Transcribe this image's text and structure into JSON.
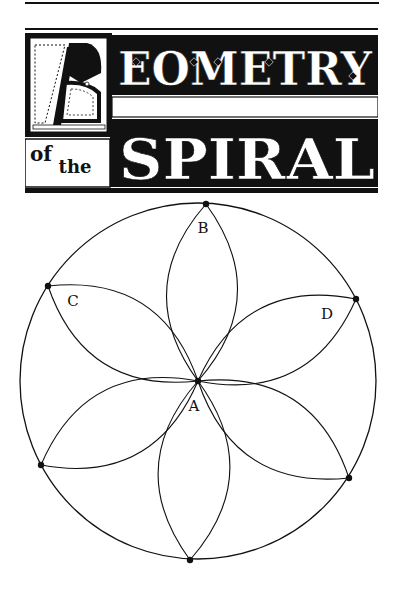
{
  "title": {
    "initial": "G",
    "line1": "EOMETRY",
    "small_words": [
      "of",
      "the"
    ],
    "line2": "SPIRAL",
    "full_text": "Geometry of the Spiral"
  },
  "diagram": {
    "circle": {
      "cx": 198,
      "cy": 381,
      "r": 178
    },
    "center_point": {
      "label": "A",
      "x": 198,
      "y": 381
    },
    "points": [
      {
        "name": "top",
        "x": 206,
        "y": 204
      },
      {
        "name": "upper-left",
        "x": 48,
        "y": 286
      },
      {
        "name": "upper-right",
        "x": 356,
        "y": 299
      },
      {
        "name": "lower-left",
        "x": 41,
        "y": 465
      },
      {
        "name": "lower-right",
        "x": 349,
        "y": 478
      },
      {
        "name": "bottom",
        "x": 190,
        "y": 560
      }
    ],
    "labels": [
      {
        "text": "A",
        "x": 194,
        "y": 411
      },
      {
        "text": "B",
        "x": 203,
        "y": 233
      },
      {
        "text": "C",
        "x": 73,
        "y": 306
      },
      {
        "text": "D",
        "x": 327,
        "y": 319
      }
    ],
    "colors": {
      "ink": "#111111",
      "paper": "#ffffff"
    }
  }
}
